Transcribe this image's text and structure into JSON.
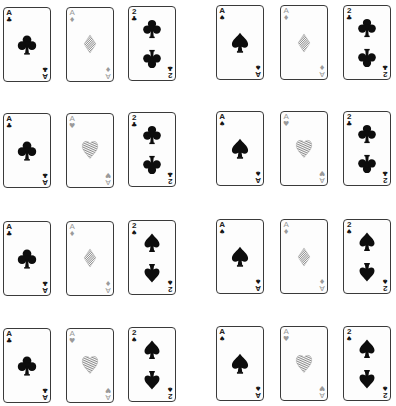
{
  "figure": {
    "colors": {
      "ink": "#0d0d0d",
      "hatched": "#8c8c8c",
      "border": "#3a3a3a"
    },
    "groups": [
      {
        "row": 1,
        "col": 1,
        "cards": [
          {
            "rank": "A",
            "suit": "club"
          },
          {
            "rank": "A",
            "suit": "diamond"
          },
          {
            "rank": "2",
            "suit": "club"
          }
        ]
      },
      {
        "row": 1,
        "col": 2,
        "cards": [
          {
            "rank": "A",
            "suit": "spade"
          },
          {
            "rank": "A",
            "suit": "diamond"
          },
          {
            "rank": "2",
            "suit": "club"
          }
        ]
      },
      {
        "row": 2,
        "col": 1,
        "cards": [
          {
            "rank": "A",
            "suit": "club"
          },
          {
            "rank": "A",
            "suit": "heart"
          },
          {
            "rank": "2",
            "suit": "club"
          }
        ]
      },
      {
        "row": 2,
        "col": 2,
        "cards": [
          {
            "rank": "A",
            "suit": "spade"
          },
          {
            "rank": "A",
            "suit": "heart"
          },
          {
            "rank": "2",
            "suit": "club"
          }
        ]
      },
      {
        "row": 3,
        "col": 1,
        "cards": [
          {
            "rank": "A",
            "suit": "club"
          },
          {
            "rank": "A",
            "suit": "diamond"
          },
          {
            "rank": "2",
            "suit": "spade"
          }
        ]
      },
      {
        "row": 3,
        "col": 2,
        "cards": [
          {
            "rank": "A",
            "suit": "spade"
          },
          {
            "rank": "A",
            "suit": "diamond"
          },
          {
            "rank": "2",
            "suit": "spade"
          }
        ]
      },
      {
        "row": 4,
        "col": 1,
        "cards": [
          {
            "rank": "A",
            "suit": "club"
          },
          {
            "rank": "A",
            "suit": "heart"
          },
          {
            "rank": "2",
            "suit": "spade"
          }
        ]
      },
      {
        "row": 4,
        "col": 2,
        "cards": [
          {
            "rank": "A",
            "suit": "spade"
          },
          {
            "rank": "A",
            "suit": "heart"
          },
          {
            "rank": "2",
            "suit": "spade"
          }
        ]
      }
    ]
  }
}
